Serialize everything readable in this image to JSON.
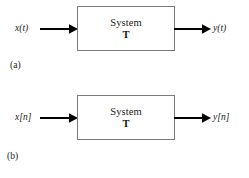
{
  "figure": {
    "type": "block-diagram",
    "background_color": "#ffffff",
    "line_color": "#000000",
    "box_border_color": "#7b7b7b",
    "panels": [
      {
        "id": "a",
        "caption": "(a)",
        "input_label": "x(t)",
        "output_label": "y(t)",
        "block": {
          "title": "System",
          "operator": "T"
        },
        "input_arrow_icon": "right-arrow-icon",
        "output_arrow_icon": "right-arrow-icon"
      },
      {
        "id": "b",
        "caption": "(b)",
        "input_label": "x[n]",
        "output_label": "y[n]",
        "block": {
          "title": "System",
          "operator": "T"
        },
        "input_arrow_icon": "right-arrow-icon",
        "output_arrow_icon": "right-arrow-icon"
      }
    ]
  }
}
